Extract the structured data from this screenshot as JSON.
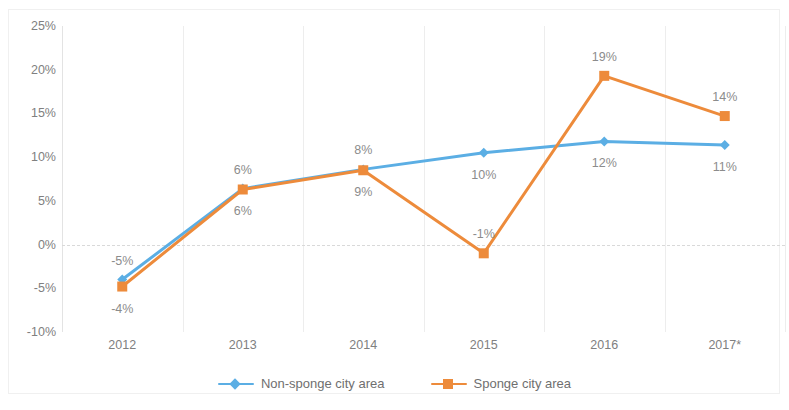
{
  "chart_data": {
    "type": "line",
    "title": "",
    "subtitle": "",
    "xlabel": "",
    "ylabel": "",
    "categories": [
      "2012",
      "2013",
      "2014",
      "2015",
      "2016",
      "2017*"
    ],
    "series": [
      {
        "name": "Non-sponge city area",
        "color": "#5BAEE4",
        "marker": "diamond",
        "values": [
          -4,
          6.4,
          8.6,
          10.5,
          11.8,
          11.4
        ],
        "labels": [
          "-5%",
          "6%",
          "8%",
          "10%",
          "12%",
          "11%"
        ],
        "label_positions": [
          "above",
          "above",
          "above",
          "below",
          "below",
          "below"
        ]
      },
      {
        "name": "Sponge city area",
        "color": "#ED8B3B",
        "marker": "square",
        "values": [
          -4.8,
          6.3,
          8.5,
          -1,
          19.3,
          14.7
        ],
        "labels": [
          "-4%",
          "6%",
          "9%",
          "-1%",
          "19%",
          "14%"
        ],
        "label_positions": [
          "below",
          "below",
          "below",
          "above",
          "above",
          "above"
        ]
      }
    ],
    "ylim": [
      -10,
      25
    ],
    "yticks": [
      25,
      20,
      15,
      10,
      5,
      0,
      -5,
      -10
    ],
    "ytick_labels": [
      "25%",
      "20%",
      "15%",
      "10%",
      "5%",
      "0%",
      "-5%",
      "-10%"
    ],
    "grid": {
      "vertical": true,
      "horizontal": false,
      "zero_line": true
    },
    "legend": {
      "position": "bottom"
    }
  },
  "axes": {
    "y_ticks": [
      "25%",
      "20%",
      "15%",
      "10%",
      "5%",
      "0%",
      "-5%",
      "-10%"
    ],
    "x_ticks": [
      "2012",
      "2013",
      "2014",
      "2015",
      "2016",
      "2017*"
    ]
  },
  "legend": {
    "items": [
      {
        "label": "Non-sponge city area",
        "color": "#5BAEE4",
        "marker": "diamond"
      },
      {
        "label": "Sponge city area",
        "color": "#ED8B3B",
        "marker": "square"
      }
    ]
  },
  "colors": {
    "non_sponge": "#5BAEE4",
    "sponge": "#ED8B3B",
    "grid": "#ededed",
    "text": "#808080",
    "background": "#ffffff"
  }
}
